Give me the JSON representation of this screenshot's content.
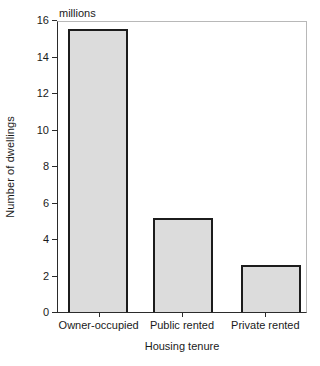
{
  "chart_data": {
    "type": "bar",
    "title": "",
    "subtitle": "",
    "unit_label": "millions",
    "xlabel": "Housing tenure",
    "ylabel": "Number of dwellings",
    "categories": [
      "Owner-occupied",
      "Public rented",
      "Private rented"
    ],
    "values": [
      15.5,
      5.15,
      2.55
    ],
    "ylim": [
      0,
      16
    ],
    "yticks": [
      0,
      2,
      4,
      6,
      8,
      10,
      12,
      14,
      16
    ],
    "ytick_labels": [
      "0",
      "2",
      "4",
      "6",
      "8",
      "10",
      "12",
      "14",
      "16"
    ],
    "grid": false,
    "legend": null,
    "colors": {
      "bar_fill": "#dcdcdc",
      "bar_edge": "#1c1c1c",
      "axis": "#2b2b2b",
      "frame": "#b8b8b8",
      "text": "#1a1a1a",
      "background": "#ffffff"
    }
  }
}
